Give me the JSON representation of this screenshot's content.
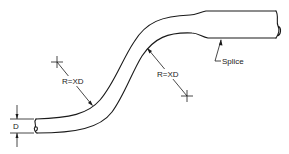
{
  "diagram": {
    "labels": {
      "diameter": "D",
      "radius_upper_left": "R=XD",
      "radius_lower_right": "R=XD",
      "splice": "Splice"
    },
    "colors": {
      "line": "#1a1a1a",
      "background": "#ffffff"
    }
  }
}
